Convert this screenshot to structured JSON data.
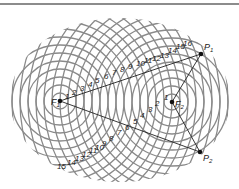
{
  "diagram": {
    "type": "two-source interference pattern",
    "colors": {
      "wavefront": "#8a8a8a",
      "line": "#222222",
      "point": "#111111",
      "border": "#8c8c8c"
    },
    "sources": [
      {
        "id": "F1",
        "label": "F",
        "subscript": "1",
        "x": 60,
        "y": 101
      },
      {
        "id": "F2",
        "label": "F",
        "subscript": "2",
        "x": 172,
        "y": 102
      }
    ],
    "points": [
      {
        "id": "P1",
        "label": "P",
        "subscript": "1",
        "x": 201,
        "y": 54
      },
      {
        "id": "P2",
        "label": "P",
        "subscript": "2",
        "x": 200,
        "y": 152
      }
    ],
    "wavefront_spacing": 8,
    "wavefront_count": 22,
    "upper_path_labels": [
      "1",
      "2",
      "3",
      "4",
      "5",
      "6",
      "7",
      "8",
      "9",
      "10",
      "11",
      "12",
      "13",
      "14",
      "15",
      "16"
    ],
    "lower_path_labels": [
      "1",
      "2",
      "3",
      "4",
      "5",
      "6",
      "7",
      "8",
      "9",
      "10",
      "11",
      "12",
      "13",
      "14",
      "15"
    ]
  }
}
